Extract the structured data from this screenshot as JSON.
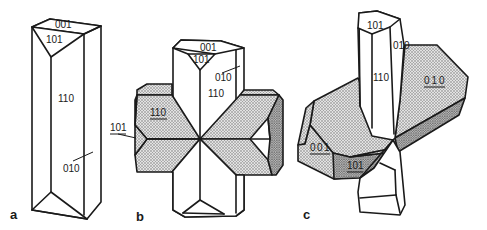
{
  "figure": {
    "colors": {
      "line": "#1a1a1a",
      "background": "#ffffff",
      "stipple": "#8a8a8a"
    }
  },
  "panels": [
    {
      "letter": "a",
      "labels": {
        "top": "001",
        "pyramid": "101",
        "prism": "110",
        "side": "010"
      }
    },
    {
      "letter": "b",
      "labels": {
        "top": "001",
        "pyramid": "101",
        "side": "010",
        "prism": "110",
        "arm_face": "110",
        "arm_side": "101"
      }
    },
    {
      "letter": "c",
      "labels": {
        "pyramid": "101",
        "side": "010",
        "prism": "110",
        "plate_face": "010",
        "plate_top": "001",
        "plate_pyramid": "101"
      }
    }
  ]
}
